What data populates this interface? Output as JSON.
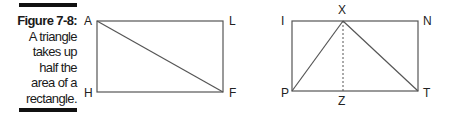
{
  "caption": {
    "number": "Figure 7-8:",
    "lines": [
      "A triangle",
      "takes up",
      "half the",
      "area of a",
      "rectangle."
    ]
  },
  "figure_left": {
    "labels": {
      "top_left": "A",
      "top_right": "L",
      "bottom_left": "H",
      "bottom_right": "F"
    }
  },
  "figure_right": {
    "labels": {
      "top_left": "I",
      "top_mid": "X",
      "top_right": "N",
      "bottom_left": "P",
      "bottom_mid": "Z",
      "bottom_right": "T"
    }
  },
  "colors": {
    "line": "#555555",
    "bar": "#111111"
  }
}
